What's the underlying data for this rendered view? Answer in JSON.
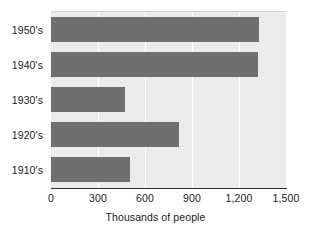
{
  "chart_data": {
    "type": "bar",
    "orientation": "horizontal",
    "title": "",
    "xlabel": "Thousands of people",
    "ylabel": "",
    "categories": [
      "1950's",
      "1940's",
      "1930's",
      "1920's",
      "1910's"
    ],
    "values": [
      1330,
      1320,
      475,
      820,
      505
    ],
    "xlim": [
      0,
      1500
    ],
    "xticks": [
      0,
      300,
      600,
      900,
      1200,
      1500
    ],
    "xtick_labels": [
      "0",
      "300",
      "600",
      "900",
      "1,200",
      "1,500"
    ],
    "grid": true,
    "grid_axis": "x",
    "legend": false,
    "series": [
      {
        "name": "Thousands of people",
        "values": [
          1330,
          1320,
          475,
          820,
          505
        ]
      }
    ],
    "bar_color": "#6f6f6f",
    "plot_background": "#ebebeb",
    "gridline_color": "#ffffff",
    "axis_color": "#2b2b2b"
  }
}
